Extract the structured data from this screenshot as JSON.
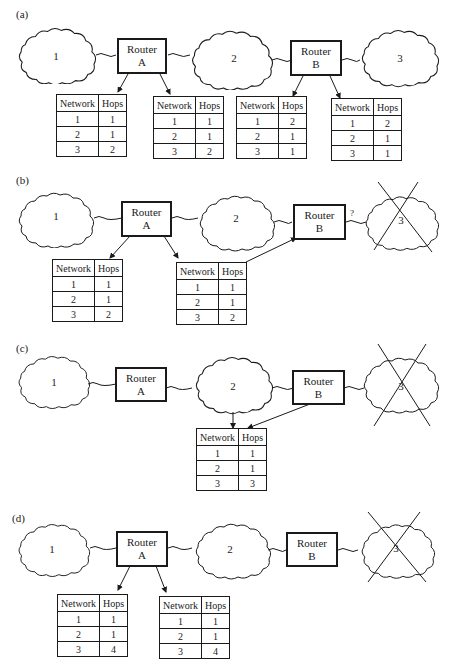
{
  "panels": [
    {
      "label": "(a)",
      "networks": [
        "1",
        "2",
        "3"
      ],
      "routers": [
        {
          "line1": "Router",
          "line2": "A"
        },
        {
          "line1": "Router",
          "line2": "B"
        }
      ],
      "failed_network": null,
      "tables": [
        {
          "headers": [
            "Network",
            "Hops"
          ],
          "rows": [
            [
              "1",
              "1"
            ],
            [
              "2",
              "1"
            ],
            [
              "3",
              "2"
            ]
          ]
        },
        {
          "headers": [
            "Network",
            "Hops"
          ],
          "rows": [
            [
              "1",
              "1"
            ],
            [
              "2",
              "1"
            ],
            [
              "3",
              "2"
            ]
          ]
        },
        {
          "headers": [
            "Network",
            "Hops"
          ],
          "rows": [
            [
              "1",
              "2"
            ],
            [
              "2",
              "1"
            ],
            [
              "3",
              "1"
            ]
          ]
        },
        {
          "headers": [
            "Network",
            "Hops"
          ],
          "rows": [
            [
              "1",
              "2"
            ],
            [
              "2",
              "1"
            ],
            [
              "3",
              "1"
            ]
          ]
        }
      ]
    },
    {
      "label": "(b)",
      "networks": [
        "1",
        "2",
        "3"
      ],
      "routers": [
        {
          "line1": "Router",
          "line2": "A"
        },
        {
          "line1": "Router",
          "line2": "B"
        }
      ],
      "failed_network": "3",
      "link_annotation": "?",
      "tables": [
        {
          "headers": [
            "Network",
            "Hops"
          ],
          "rows": [
            [
              "1",
              "1"
            ],
            [
              "2",
              "1"
            ],
            [
              "3",
              "2"
            ]
          ]
        },
        {
          "headers": [
            "Network",
            "Hops"
          ],
          "rows": [
            [
              "1",
              "1"
            ],
            [
              "2",
              "1"
            ],
            [
              "3",
              "2"
            ]
          ]
        }
      ]
    },
    {
      "label": "(c)",
      "networks": [
        "1",
        "2",
        "3"
      ],
      "routers": [
        {
          "line1": "Router",
          "line2": "A"
        },
        {
          "line1": "Router",
          "line2": "B"
        }
      ],
      "failed_network": "3",
      "tables": [
        {
          "headers": [
            "Network",
            "Hops"
          ],
          "rows": [
            [
              "1",
              "1"
            ],
            [
              "2",
              "1"
            ],
            [
              "3",
              "3"
            ]
          ]
        }
      ]
    },
    {
      "label": "(d)",
      "networks": [
        "1",
        "2",
        "3"
      ],
      "routers": [
        {
          "line1": "Router",
          "line2": "A"
        },
        {
          "line1": "Router",
          "line2": "B"
        }
      ],
      "failed_network": "3",
      "tables": [
        {
          "headers": [
            "Network",
            "Hops"
          ],
          "rows": [
            [
              "1",
              "1"
            ],
            [
              "2",
              "1"
            ],
            [
              "3",
              "4"
            ]
          ]
        },
        {
          "headers": [
            "Network",
            "Hops"
          ],
          "rows": [
            [
              "1",
              "1"
            ],
            [
              "2",
              "1"
            ],
            [
              "3",
              "4"
            ]
          ]
        }
      ]
    }
  ]
}
